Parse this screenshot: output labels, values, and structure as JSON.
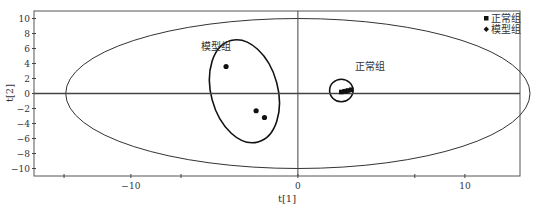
{
  "chart_data": {
    "type": "scatter",
    "title": "",
    "xlabel": "t[1]",
    "ylabel": "t[2]",
    "xlim": [
      -15.8,
      13.3
    ],
    "ylim": [
      -11,
      11
    ],
    "x_ticks": [
      -10,
      0,
      10
    ],
    "x_tick_labels": [
      "−10",
      "0",
      "10"
    ],
    "x_minor_ticks": [
      -14,
      -7,
      7,
      14
    ],
    "y_ticks": [
      -10,
      -8,
      -6,
      -4,
      -2,
      0,
      2,
      4,
      6,
      8,
      10
    ],
    "y_tick_labels": [
      "−10",
      "−8",
      "−6",
      "−4",
      "−2",
      "0",
      "2",
      "4",
      "6",
      "8",
      "10"
    ],
    "grid": false,
    "legend_position": "top-right",
    "series": [
      {
        "name": "正常组",
        "marker": "square",
        "color": "#111111",
        "points": [
          [
            2.6,
            0.2
          ],
          [
            2.9,
            0.3
          ],
          [
            3.0,
            0.4
          ],
          [
            3.2,
            0.5
          ],
          [
            2.8,
            0.3
          ]
        ]
      },
      {
        "name": "模型组",
        "marker": "diamond",
        "color": "#111111",
        "points": [
          [
            -4.3,
            3.6
          ],
          [
            -2.5,
            -2.3
          ],
          [
            -2.0,
            -3.2
          ]
        ]
      }
    ],
    "hotelling_ellipse": {
      "center": [
        0,
        0
      ],
      "rx": 13.9,
      "ry": 10
    },
    "group_ellipses": [
      {
        "label": "模型组",
        "center": [
          -3.2,
          0.3
        ],
        "rx": 2.0,
        "ry": 7.0,
        "rotation_deg": -15,
        "label_at": [
          -5.8,
          5.8
        ]
      },
      {
        "label": "正常组",
        "center": [
          2.6,
          0.4
        ],
        "rx": 0.7,
        "ry": 1.5,
        "rotation_deg": 0,
        "label_at": [
          3.4,
          3.2
        ]
      }
    ]
  }
}
